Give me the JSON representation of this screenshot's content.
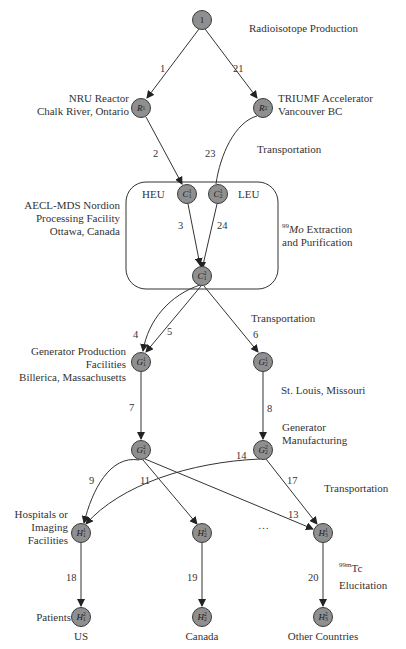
{
  "colors": {
    "node_fill": "#8f8f8f",
    "node_stroke": "#3a3a3a",
    "edge": "#333333",
    "text": "#333333"
  },
  "stage_labels": {
    "radioisotope_production": "Radioisotope Production",
    "transportation_1": "Transportation",
    "extraction_prefix_sup": "99",
    "extraction_prefix_italic": "Mo",
    "extraction_line1_rest": " Extraction",
    "extraction_line2": "and Purification",
    "transportation_2": "Transportation",
    "generator_manufacturing_line1": "Generator",
    "generator_manufacturing_line2": "Manufacturing",
    "transportation_3": "Transportation",
    "elucitation_sup": "99m",
    "elucitation_tc": "Tc",
    "elucitation": "Elucitation"
  },
  "facility_labels": {
    "nru_line1": "NRU Reactor",
    "nru_line2": "Chalk River, Ontario",
    "triumf_line1": "TRIUMF Accelerator",
    "triumf_line2": "Vancouver BC",
    "aecl_line1": "AECL-MDS Nordion",
    "aecl_line2": "Processing Facility",
    "aecl_line3": "Ottawa, Canada",
    "heu": "HEU",
    "leu": "LEU",
    "genprod_line1": "Generator Production",
    "genprod_line2": "Facilities",
    "genprod_line3": "Billerica, Massachusetts",
    "stlouis": "St. Louis, Missouri",
    "hospitals_line1": "Hospitals or",
    "hospitals_line2": "Imaging",
    "hospitals_line3": "Facilities",
    "patients": "Patients",
    "us": "US",
    "canada": "Canada",
    "other": "Other Countries",
    "ellipsis": "…"
  },
  "nodes": [
    {
      "id": "origin",
      "base": "1",
      "sup": "",
      "sub": "",
      "x": 202,
      "y": 20
    },
    {
      "id": "R1",
      "base": "R",
      "sup": "",
      "sub": "1",
      "x": 141,
      "y": 108
    },
    {
      "id": "R2",
      "base": "R",
      "sup": "",
      "sub": "2",
      "x": 263,
      "y": 108
    },
    {
      "id": "C11",
      "base": "C",
      "sup": "1",
      "sub": "1",
      "x": 187,
      "y": 194
    },
    {
      "id": "C12",
      "base": "C",
      "sup": "1",
      "sub": "2",
      "x": 218,
      "y": 194
    },
    {
      "id": "C21",
      "base": "C",
      "sup": "2",
      "sub": "1",
      "x": 202,
      "y": 276
    },
    {
      "id": "G11",
      "base": "G",
      "sup": "1",
      "sub": "1",
      "x": 141,
      "y": 362
    },
    {
      "id": "G12",
      "base": "G",
      "sup": "1",
      "sub": "2",
      "x": 263,
      "y": 362
    },
    {
      "id": "G21",
      "base": "G",
      "sup": "2",
      "sub": "1",
      "x": 141,
      "y": 450
    },
    {
      "id": "G22",
      "base": "G",
      "sup": "2",
      "sub": "2",
      "x": 263,
      "y": 450
    },
    {
      "id": "H11",
      "base": "H",
      "sup": "1",
      "sub": "1",
      "x": 81,
      "y": 533
    },
    {
      "id": "H12",
      "base": "H",
      "sup": "1",
      "sub": "2",
      "x": 202,
      "y": 533
    },
    {
      "id": "H13",
      "base": "H",
      "sup": "1",
      "sub": "3",
      "x": 323,
      "y": 533
    },
    {
      "id": "H21",
      "base": "H",
      "sup": "2",
      "sub": "1",
      "x": 81,
      "y": 617
    },
    {
      "id": "H22",
      "base": "H",
      "sup": "2",
      "sub": "2",
      "x": 202,
      "y": 617
    },
    {
      "id": "H23",
      "base": "H",
      "sup": "2",
      "sub": "3",
      "x": 323,
      "y": 617
    }
  ],
  "edges": [
    {
      "label": "1",
      "from": "origin",
      "to": "R1"
    },
    {
      "label": "21",
      "from": "origin",
      "to": "R2"
    },
    {
      "label": "2",
      "from": "R1",
      "to": "C11"
    },
    {
      "label": "23",
      "from": "R2",
      "to": "C12"
    },
    {
      "label": "3",
      "from": "C11",
      "to": "C21"
    },
    {
      "label": "24",
      "from": "C12",
      "to": "C21"
    },
    {
      "label": "4",
      "from": "C21",
      "to": "G11"
    },
    {
      "label": "5",
      "from": "C21",
      "to": "G11"
    },
    {
      "label": "6",
      "from": "C21",
      "to": "G12"
    },
    {
      "label": "7",
      "from": "G11",
      "to": "G21"
    },
    {
      "label": "8",
      "from": "G12",
      "to": "G22"
    },
    {
      "label": "9",
      "from": "G21",
      "to": "H11"
    },
    {
      "label": "11",
      "from": "G21",
      "to": "H12"
    },
    {
      "label": "13",
      "from": "G21",
      "to": "H13"
    },
    {
      "label": "14",
      "from": "G22",
      "to": "H11"
    },
    {
      "label": "17",
      "from": "G22",
      "to": "H13"
    },
    {
      "label": "18",
      "from": "H11",
      "to": "H21"
    },
    {
      "label": "19",
      "from": "H12",
      "to": "H22"
    },
    {
      "label": "20",
      "from": "H13",
      "to": "H23"
    }
  ]
}
